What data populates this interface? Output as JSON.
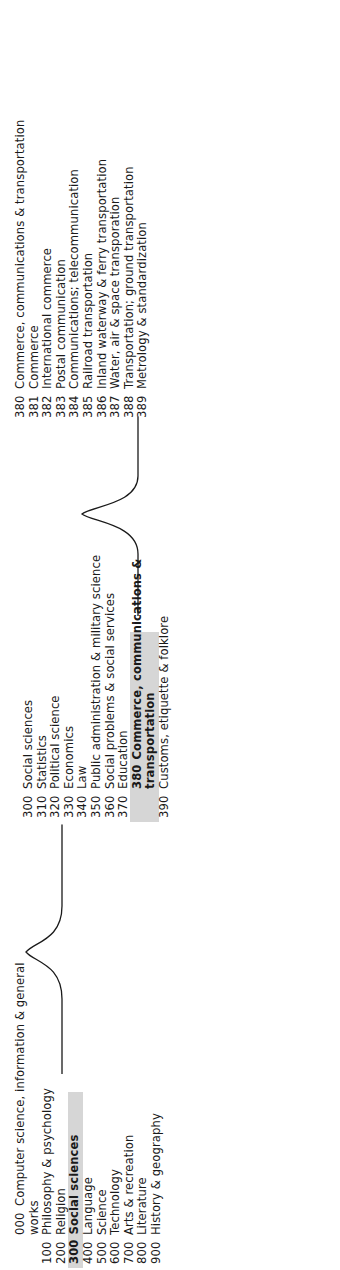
{
  "diagram": {
    "type": "hierarchy-brace-diagram",
    "highlight_color": "#cfcfcf",
    "text_color": "#1a1a1a",
    "background": "#ffffff",
    "orientation": "rotated-90-counterclockwise"
  },
  "levels": [
    {
      "name": "main-classes",
      "highlight_index": 3,
      "items": [
        {
          "num": "000",
          "label": "Computer science, information & general",
          "label2": "works",
          "bold": false
        },
        {
          "num": "100",
          "label": "Philosophy & psychology",
          "bold": false
        },
        {
          "num": "200",
          "label": "Religion",
          "bold": false
        },
        {
          "num": "300",
          "label": "Social sciences",
          "bold": true
        },
        {
          "num": "400",
          "label": "Language",
          "bold": false
        },
        {
          "num": "500",
          "label": "Science",
          "bold": false
        },
        {
          "num": "600",
          "label": "Technology",
          "bold": false
        },
        {
          "num": "700",
          "label": "Arts & recreation",
          "bold": false
        },
        {
          "num": "800",
          "label": "Literature",
          "bold": false
        },
        {
          "num": "900",
          "label": "History & geography",
          "bold": false
        }
      ]
    },
    {
      "name": "social-sciences-divisions",
      "highlight_index": 8,
      "items": [
        {
          "num": "300",
          "label": "Social sciences",
          "bold": false
        },
        {
          "num": "310",
          "label": "Statistics",
          "bold": false
        },
        {
          "num": "320",
          "label": "Political science",
          "bold": false
        },
        {
          "num": "330",
          "label": "Economics",
          "bold": false
        },
        {
          "num": "340",
          "label": "Law",
          "bold": false
        },
        {
          "num": "350",
          "label": "Public administration & military science",
          "bold": false
        },
        {
          "num": "360",
          "label": "Social problems & social services",
          "bold": false
        },
        {
          "num": "370",
          "label": "Education",
          "bold": false
        },
        {
          "num": "380",
          "label": "Commerce, communications &",
          "label2": "transportation",
          "bold": true
        },
        {
          "num": "390",
          "label": "Customs, etiquette & folklore",
          "bold": false
        }
      ]
    },
    {
      "name": "commerce-sections",
      "highlight_index": -1,
      "items": [
        {
          "num": "380",
          "label": "Commerce, communications & transportation",
          "bold": false
        },
        {
          "num": "381",
          "label": "Commerce",
          "bold": false
        },
        {
          "num": "382",
          "label": "International commerce",
          "bold": false
        },
        {
          "num": "383",
          "label": "Postal communication",
          "bold": false
        },
        {
          "num": "384",
          "label": "Communications; telecommunication",
          "bold": false
        },
        {
          "num": "385",
          "label": "Railroad transportation",
          "bold": false
        },
        {
          "num": "386",
          "label": "Inland waterway & ferry transportation",
          "bold": false
        },
        {
          "num": "387",
          "label": "Water, air & space transporation",
          "bold": false
        },
        {
          "num": "388",
          "label": "Transportation; ground transportation",
          "bold": false
        },
        {
          "num": "389",
          "label": "Metrology & standardization",
          "bold": false
        }
      ]
    }
  ],
  "connectors": [
    {
      "name": "brace-main-to-300s",
      "from": "300 Social sciences",
      "to": "300-390 divisions"
    },
    {
      "name": "brace-300s-to-380s",
      "from": "380 Commerce, communications & transportation",
      "to": "380-389 sections"
    }
  ]
}
